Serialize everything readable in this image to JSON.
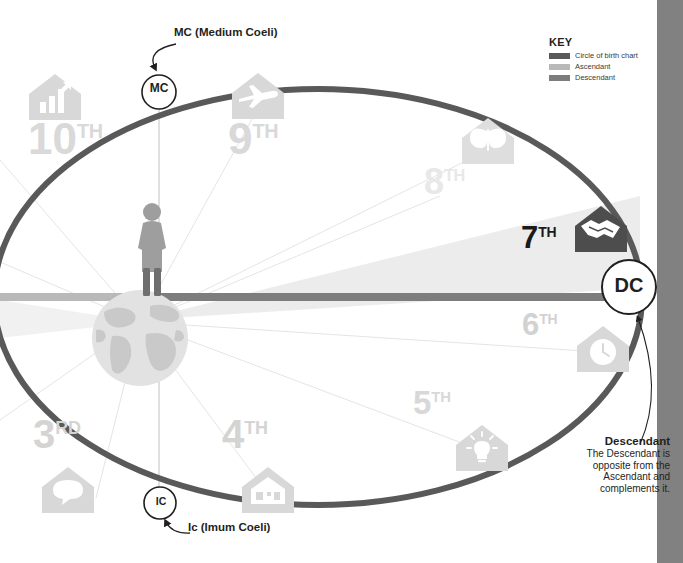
{
  "diagram": {
    "center_figure": "person-standing-on-globe"
  },
  "key": {
    "title": "KEY",
    "items": [
      {
        "label": "Circle of birth chart",
        "color": "#595959",
        "name": "circle-of-birth-chart"
      },
      {
        "label": "Ascendant",
        "color": "#b9b9b9",
        "name": "ascendant"
      },
      {
        "label": "Descendant",
        "color": "#7d7d7d",
        "name": "descendant"
      }
    ]
  },
  "nodes": [
    {
      "id": "MC",
      "label": "MC",
      "callout": "MC (Medium Coeli)"
    },
    {
      "id": "IC",
      "label": "IC",
      "callout": "Ic (Imum Coeli)"
    },
    {
      "id": "DC",
      "label": "DC",
      "callout_title": "Descendant",
      "callout_body": "The Descendant is opposite from the Ascendant and complements it."
    }
  ],
  "houses": [
    {
      "number": "10",
      "ordinal": "TH",
      "icon": "house-career-chart-icon",
      "highlighted": false
    },
    {
      "number": "9",
      "ordinal": "TH",
      "icon": "house-airplane-icon",
      "highlighted": false
    },
    {
      "number": "8",
      "ordinal": "TH",
      "icon": "house-butterfly-icon",
      "highlighted": false
    },
    {
      "number": "7",
      "ordinal": "TH",
      "icon": "house-handshake-icon",
      "highlighted": true
    },
    {
      "number": "6",
      "ordinal": "TH",
      "icon": "house-clock-icon",
      "highlighted": false
    },
    {
      "number": "5",
      "ordinal": "TH",
      "icon": "house-lightbulb-icon",
      "highlighted": false
    },
    {
      "number": "4",
      "ordinal": "TH",
      "icon": "house-home-icon",
      "highlighted": false
    },
    {
      "number": "3",
      "ordinal": "RD",
      "icon": "house-speech-bubble-icon",
      "highlighted": false
    }
  ],
  "colors": {
    "chart_circle": "#595959",
    "ascendant": "#b9b9b9",
    "descendant": "#7d7d7d",
    "house_icon": "#d8d8d8",
    "house_icon_dark": "#4d4d4d",
    "edge_bar": "#818181",
    "wedge": "#ececec",
    "text": "#231f20"
  }
}
